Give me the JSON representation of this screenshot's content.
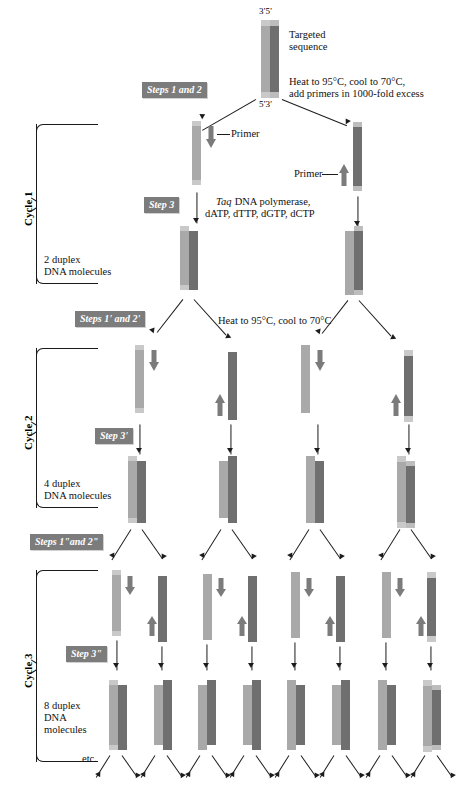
{
  "figure": {
    "targeted_sequence_label": "Targeted\nsequence",
    "end_labels": {
      "top": "3'5'",
      "bottom": "5'3'"
    },
    "etc_label": "etc.",
    "primer_label": "Primer"
  },
  "colors": {
    "strand_light": "#a9a9a9",
    "strand_light_tip": "#c9c9c9",
    "strand_dark": "#6f6f6f",
    "strand_dark_tip": "#bdbdbd",
    "primer_arrow": "#7b7b7b",
    "chip_background": "#7c7c7c",
    "chip_text": "#ffffff",
    "ink": "#1c1c1c",
    "page_background": "#ffffff"
  },
  "annotations": {
    "denature_primers": "Heat to 95°C, cool to 70°C,\nadd primers in 1000-fold excess",
    "polymerase_line1": "Taq",
    "polymerase_rest": " DNA polymerase,",
    "polymerase_line2": "dATP, dTTP, dGTP, dCTP",
    "denature_2": "Heat to 95°C, cool to 70°C"
  },
  "steps": [
    {
      "id": "steps-1-2",
      "label": "Steps 1 and 2"
    },
    {
      "id": "step-3",
      "label": "Step 3"
    },
    {
      "id": "steps-1p-2p",
      "label": "Steps 1' and 2'"
    },
    {
      "id": "step-3p",
      "label": "Step 3'"
    },
    {
      "id": "steps-1pp-2pp",
      "label": "Steps 1\"and 2\""
    },
    {
      "id": "step-3pp",
      "label": "Step 3\""
    }
  ],
  "cycles": [
    {
      "id": "cycle-1",
      "label": "Cycle 1",
      "product_count": "2 duplex",
      "product_label": "2 duplex\nDNA molecules"
    },
    {
      "id": "cycle-2",
      "label": "Cycle 2",
      "product_count": "4 duplex",
      "product_label": "4 duplex\nDNA molecules"
    },
    {
      "id": "cycle-3",
      "label": "Cycle 3",
      "product_count": "8 duplex",
      "product_label": "8 duplex\nDNA\nmolecules"
    }
  ],
  "product_labels": {
    "cycle1": "2 duplex\nDNA molecules",
    "cycle2": "4 duplex\nDNA molecules",
    "cycle3": "8 duplex\nDNA\nmolecules"
  },
  "icons": {
    "primer_down": "primer-down-arrow-icon",
    "primer_up": "primer-up-arrow-icon",
    "reaction_arrow": "reaction-arrow-icon",
    "split_arrow": "split-arrow-icon"
  }
}
